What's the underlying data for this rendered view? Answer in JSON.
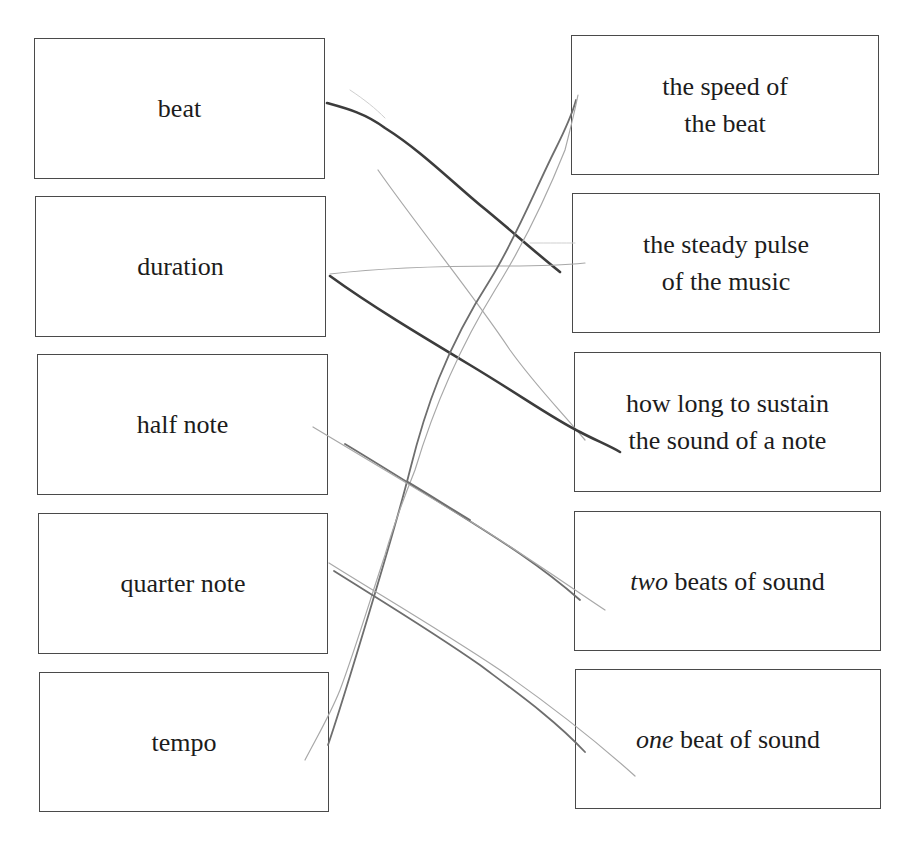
{
  "worksheet": {
    "left_column": {
      "terms": [
        {
          "label": "beat"
        },
        {
          "label": "duration"
        },
        {
          "label": "half note"
        },
        {
          "label": "quarter note"
        },
        {
          "label": "tempo"
        }
      ]
    },
    "right_column": {
      "definitions": [
        {
          "line1": "the speed of",
          "line2": "the beat"
        },
        {
          "line1": "the steady pulse",
          "line2": "of the music"
        },
        {
          "line1": "how long to sustain",
          "line2": "the sound of a note"
        },
        {
          "emphasis": "two",
          "rest": " beats of sound"
        },
        {
          "emphasis": "one",
          "rest": " beat of sound"
        }
      ]
    },
    "drawn_matches": [
      {
        "from": "beat",
        "to": "the steady pulse of the music"
      },
      {
        "from": "duration",
        "to": "how long to sustain the sound of a note"
      },
      {
        "from": "half note",
        "to": "two beats of sound"
      },
      {
        "from": "quarter note",
        "to": "one beat of sound"
      },
      {
        "from": "tempo",
        "to": "the speed of the beat"
      }
    ],
    "colors": {
      "box_border": "#4a4a4a",
      "text": "#1c1c1c",
      "pencil_dark": "#3c3c3c",
      "pencil_light": "#a8a8a8"
    }
  }
}
